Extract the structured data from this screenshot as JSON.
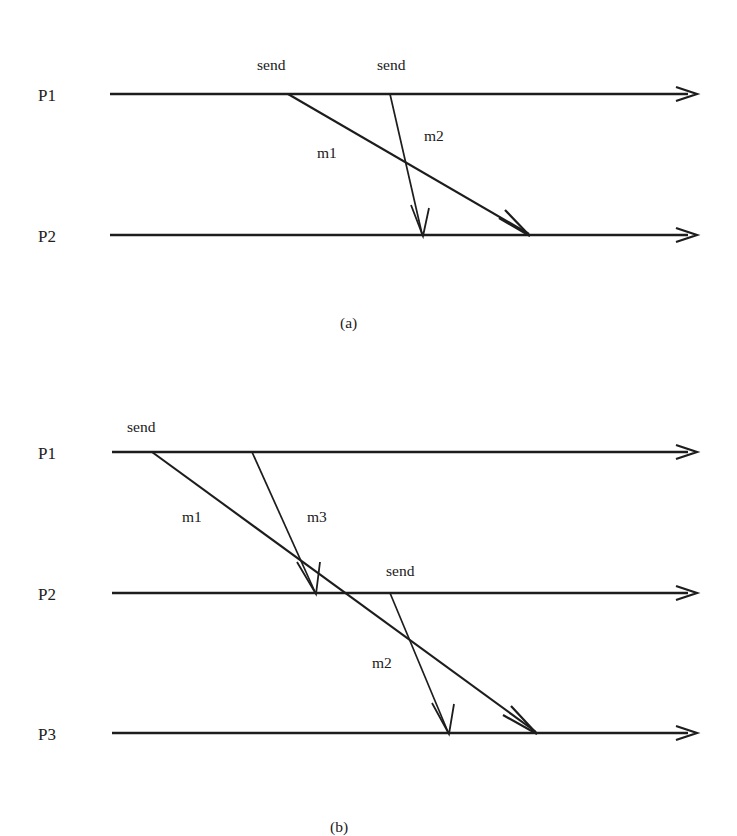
{
  "figure": {
    "type": "message-sequence-diagram",
    "background_color": "#ffffff",
    "ink_color": "#1d1d1d",
    "width": 737,
    "height": 836
  },
  "diagrams": [
    {
      "id": "a",
      "caption": "(a)",
      "caption_pos": {
        "x": 340,
        "y": 328
      },
      "timelines": [
        {
          "label": "P1",
          "label_pos": {
            "x": 38,
            "y": 101
          },
          "y": 94,
          "x_start": 110,
          "x_end": 697
        },
        {
          "label": "P2",
          "label_pos": {
            "x": 38,
            "y": 242
          },
          "y": 235,
          "x_start": 110,
          "x_end": 697
        }
      ],
      "events": [
        {
          "label": "send",
          "label_pos": {
            "x": 257,
            "y": 70
          },
          "point": {
            "x": 288,
            "y": 94
          }
        },
        {
          "label": "send",
          "label_pos": {
            "x": 377,
            "y": 70
          },
          "point": {
            "x": 390,
            "y": 94
          }
        }
      ],
      "messages": [
        {
          "label": "m1",
          "label_pos": {
            "x": 317,
            "y": 158
          },
          "from": {
            "process": "P1",
            "x": 288,
            "y": 94
          },
          "to": {
            "process": "P2",
            "x": 530,
            "y": 235
          }
        },
        {
          "label": "m2",
          "label_pos": {
            "x": 424,
            "y": 141
          },
          "from": {
            "process": "P1",
            "x": 390,
            "y": 94
          },
          "to": {
            "process": "P2",
            "x": 423,
            "y": 235
          }
        }
      ]
    },
    {
      "id": "b",
      "caption": "(b)",
      "caption_pos": {
        "x": 330,
        "y": 832
      },
      "timelines": [
        {
          "label": "P1",
          "label_pos": {
            "x": 38,
            "y": 459
          },
          "y": 452,
          "x_start": 112,
          "x_end": 697
        },
        {
          "label": "P2",
          "label_pos": {
            "x": 38,
            "y": 600
          },
          "y": 593,
          "x_start": 112,
          "x_end": 697
        },
        {
          "label": "P3",
          "label_pos": {
            "x": 38,
            "y": 740
          },
          "y": 733,
          "x_start": 112,
          "x_end": 697
        }
      ],
      "events": [
        {
          "label": "send",
          "label_pos": {
            "x": 127,
            "y": 432
          },
          "point": {
            "x": 152,
            "y": 452
          }
        },
        {
          "label": "send",
          "label_pos": {
            "x": 386,
            "y": 576
          },
          "point": {
            "x": 390,
            "y": 593
          }
        }
      ],
      "messages": [
        {
          "label": "m1",
          "label_pos": {
            "x": 182,
            "y": 522
          },
          "from": {
            "process": "P1",
            "x": 152,
            "y": 452
          },
          "to": {
            "process": "P3",
            "x": 537,
            "y": 733
          }
        },
        {
          "label": "m3",
          "label_pos": {
            "x": 307,
            "y": 522
          },
          "from": {
            "process": "P1",
            "x": 252,
            "y": 452
          },
          "to": {
            "process": "P2",
            "x": 316,
            "y": 593
          }
        },
        {
          "label": "m2",
          "label_pos": {
            "x": 372,
            "y": 668
          },
          "from": {
            "process": "P2",
            "x": 390,
            "y": 593
          },
          "to": {
            "process": "P3",
            "x": 449,
            "y": 733
          }
        }
      ]
    }
  ]
}
